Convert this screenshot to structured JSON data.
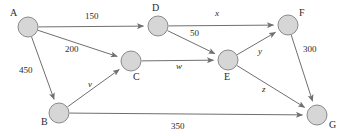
{
  "diagram": {
    "type": "directed-weighted-graph",
    "title": "",
    "width": 346,
    "height": 136,
    "colors": {
      "background": "#ffffff",
      "node_fill": "#d6d6d6",
      "node_stroke": "#8a8a8a",
      "edge_stroke": "#6f6f6f",
      "text": "#2b2b2b"
    },
    "nodes": [
      {
        "id": "A",
        "label": "A",
        "cx": 28,
        "cy": 27,
        "r": 10,
        "label_x": 10,
        "label_y": 8
      },
      {
        "id": "B",
        "label": "B",
        "cx": 59,
        "cy": 113,
        "r": 10,
        "label_x": 41,
        "label_y": 117
      },
      {
        "id": "C",
        "label": "C",
        "cx": 131,
        "cy": 61,
        "r": 10,
        "label_x": 133,
        "label_y": 72
      },
      {
        "id": "D",
        "label": "D",
        "cx": 158,
        "cy": 26,
        "r": 10,
        "label_x": 152,
        "label_y": 3
      },
      {
        "id": "E",
        "label": "E",
        "cx": 228,
        "cy": 60,
        "r": 10,
        "label_x": 224,
        "label_y": 72
      },
      {
        "id": "F",
        "label": "F",
        "cx": 288,
        "cy": 25,
        "r": 10,
        "label_x": 299,
        "label_y": 8
      },
      {
        "id": "G",
        "label": "G",
        "cx": 317,
        "cy": 115,
        "r": 10,
        "label_x": 329,
        "label_y": 120
      }
    ],
    "edges": [
      {
        "from": "A",
        "to": "D",
        "label": "150",
        "italic": false,
        "label_x": 85,
        "label_y": 12
      },
      {
        "from": "A",
        "to": "C",
        "label": "200",
        "italic": false,
        "label_x": 65,
        "label_y": 45
      },
      {
        "from": "A",
        "to": "B",
        "label": "450",
        "italic": false,
        "label_x": 19,
        "label_y": 66
      },
      {
        "from": "B",
        "to": "C",
        "label": "v",
        "italic": true,
        "label_x": 88,
        "label_y": 80
      },
      {
        "from": "B",
        "to": "G",
        "label": "350",
        "italic": false,
        "label_x": 171,
        "label_y": 122
      },
      {
        "from": "C",
        "to": "E",
        "label": "w",
        "italic": true,
        "label_x": 176,
        "label_y": 62
      },
      {
        "from": "D",
        "to": "F",
        "label": "x",
        "italic": true,
        "label_x": 215,
        "label_y": 9
      },
      {
        "from": "D",
        "to": "E",
        "label": "50",
        "italic": false,
        "label_x": 190,
        "label_y": 29
      },
      {
        "from": "E",
        "to": "F",
        "label": "y",
        "italic": true,
        "label_x": 258,
        "label_y": 47
      },
      {
        "from": "E",
        "to": "G",
        "label": "z",
        "italic": true,
        "label_x": 262,
        "label_y": 85
      },
      {
        "from": "F",
        "to": "G",
        "label": "300",
        "italic": false,
        "label_x": 303,
        "label_y": 45
      }
    ]
  }
}
